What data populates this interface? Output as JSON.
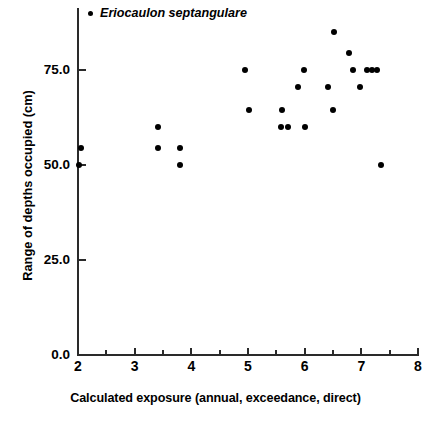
{
  "chart_data": {
    "type": "scatter",
    "title": "",
    "xlabel": "Calculated exposure (annual, exceedance, direct)",
    "ylabel": "Range of depths occupied (cm)",
    "xlim": [
      2,
      8
    ],
    "ylim": [
      0,
      88
    ],
    "grid": false,
    "legend_position": "top-left",
    "x_major_ticks": [
      2,
      3,
      4,
      5,
      6,
      7,
      8
    ],
    "x_tick_labels": [
      "2",
      "3",
      "4",
      "5",
      "6",
      "7",
      "8"
    ],
    "x_minor_ticks": [
      2.5,
      3.5,
      4.5,
      5.5,
      6.5,
      7.5
    ],
    "y_major_ticks": [
      0,
      25,
      50,
      75
    ],
    "y_tick_labels": [
      "0.0",
      "25.0",
      "50.0",
      "75.0"
    ],
    "marker_color": "#000000",
    "axis_color": "#2a2a2a",
    "series": [
      {
        "name": "Eriocaulon septangulare",
        "marker": "filled-circle",
        "color": "#000000",
        "points": [
          {
            "x": 2.05,
            "y": 54.5
          },
          {
            "x": 2.02,
            "y": 50.0
          },
          {
            "x": 3.42,
            "y": 60.0
          },
          {
            "x": 3.42,
            "y": 54.5
          },
          {
            "x": 3.8,
            "y": 54.5
          },
          {
            "x": 3.8,
            "y": 50.0
          },
          {
            "x": 4.95,
            "y": 75.0
          },
          {
            "x": 5.02,
            "y": 64.5
          },
          {
            "x": 5.6,
            "y": 64.5
          },
          {
            "x": 5.58,
            "y": 60.0
          },
          {
            "x": 5.7,
            "y": 60.0
          },
          {
            "x": 5.88,
            "y": 70.5
          },
          {
            "x": 5.98,
            "y": 75.0
          },
          {
            "x": 6.0,
            "y": 60.0
          },
          {
            "x": 6.42,
            "y": 70.5
          },
          {
            "x": 6.5,
            "y": 64.5
          },
          {
            "x": 6.52,
            "y": 85.0
          },
          {
            "x": 6.78,
            "y": 79.5
          },
          {
            "x": 6.85,
            "y": 75.0
          },
          {
            "x": 6.97,
            "y": 70.5
          },
          {
            "x": 7.1,
            "y": 75.0
          },
          {
            "x": 7.18,
            "y": 75.0
          },
          {
            "x": 7.27,
            "y": 75.0
          },
          {
            "x": 7.35,
            "y": 50.0
          }
        ]
      }
    ]
  },
  "legend": {
    "label": "Eriocaulon septangulare",
    "marker_name": "legend-dot-marker"
  }
}
